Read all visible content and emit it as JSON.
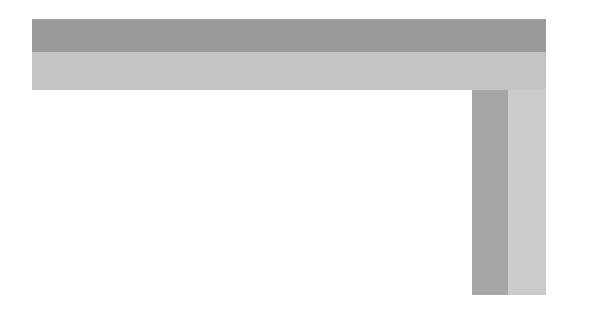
{
  "annotations": {
    "top_left": [
      "Age: Layer 1 ≥ 4 days",
      "Layer 2 ≥ 3 days",
      "Layer 3 ≥ 2 days"
    ],
    "top_right": "Age: 12Hours",
    "mid_left": [
      "Age: Layer 1 ≥ 7 days",
      "Layer 2 ≥ 4 days",
      "Layer 3 ≥ 3 days"
    ],
    "bottom_left": [
      "Age: Layers 1 & 2 ≥7 days",
      "Layer 3 ≥ 4 days"
    ],
    "center": [
      "Age: Layer 1 = 3 days",
      "Layer 2 = 2 days",
      "Layer 3 = 1 day"
    ],
    "right_upper": [
      "Age: Layer 1 = 1 day",
      "Layer 2 = 12 Hours"
    ],
    "right_lower": [
      "Age: Layer 1 = 2 day",
      "Layer 2 = 1 day",
      "Layer 3 = 12 Hours"
    ]
  },
  "table": {
    "cells": [
      "28 Days",
      "40",
      "30,000"
    ]
  },
  "colors": {
    "band_dark": "#9a9a9a",
    "band_light": "#c4c4c4",
    "text": "#2a2a2a"
  }
}
